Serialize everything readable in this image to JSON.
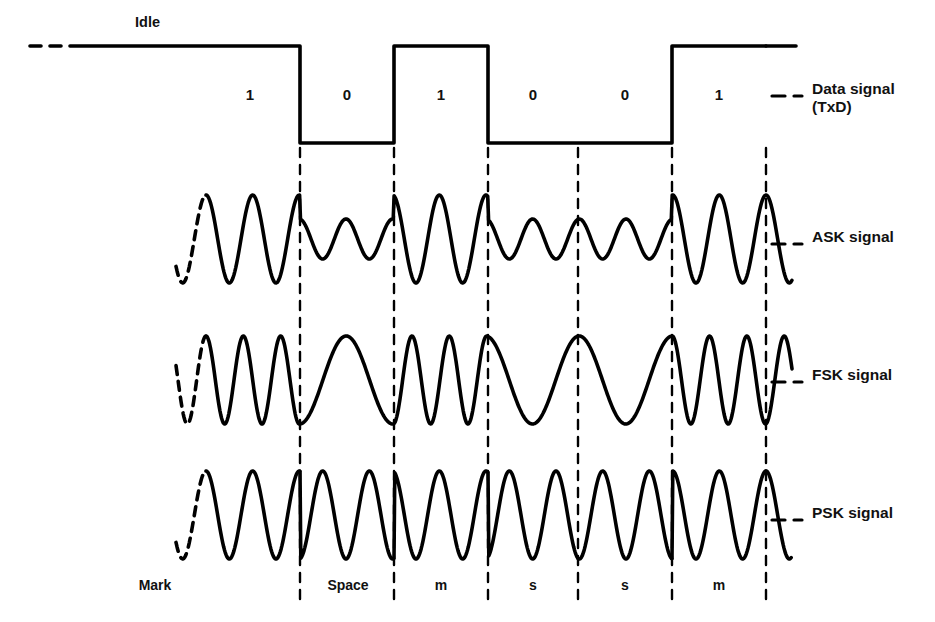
{
  "figure": {
    "idle_label": "Idle",
    "data_signal_label": "Data signal\n(TxD)",
    "ask_label": "ASK signal",
    "fsk_label": "FSK signal",
    "psk_label": "PSK signal",
    "line_color": "#000000",
    "background_color": "#ffffff"
  },
  "bits": [
    {
      "value": "1",
      "state": "mark",
      "bottom_label": "Mark"
    },
    {
      "value": "0",
      "state": "space",
      "bottom_label": "Space"
    },
    {
      "value": "1",
      "state": "mark",
      "bottom_label": "m"
    },
    {
      "value": "0",
      "state": "space",
      "bottom_label": "s"
    },
    {
      "value": "0",
      "state": "space",
      "bottom_label": "s"
    },
    {
      "value": "1",
      "state": "mark",
      "bottom_label": "m"
    }
  ],
  "chart_data": {
    "type": "line",
    "xlabel": "",
    "ylabel": "",
    "grid": false,
    "legend_position": "right",
    "bit_sequence": [
      "1",
      "0",
      "1",
      "0",
      "0",
      "1"
    ],
    "bit_boundaries_px": [
      300,
      394,
      488,
      578,
      672,
      766
    ],
    "signal_start_px": 206,
    "series": [
      {
        "name": "Data signal (TxD)",
        "type": "digital",
        "levels": [
          1,
          0,
          1,
          0,
          0,
          1
        ],
        "idle_level": 1,
        "high_y_px": 46,
        "low_y_px": 143
      },
      {
        "name": "ASK signal",
        "type": "amplitude-shift-keying",
        "center_y_px": 239,
        "amplitude_mark_px": 44,
        "amplitude_space_px": 20,
        "cycles_per_bit": 2,
        "description": "Large amplitude carrier for 1 (mark), small amplitude carrier for 0 (space)"
      },
      {
        "name": "FSK signal",
        "type": "frequency-shift-keying",
        "center_y_px": 380,
        "amplitude_px": 44,
        "cycles_per_bit_mark": 2.5,
        "cycles_per_bit_space": 1,
        "description": "High frequency carrier for 1 (mark), low frequency carrier for 0 (space)"
      },
      {
        "name": "PSK signal",
        "type": "phase-shift-keying",
        "center_y_px": 515,
        "amplitude_px": 44,
        "cycles_per_bit": 2,
        "phase_reversal_at_bit_change": true,
        "description": "Constant amplitude and frequency; phase reverses 180 degrees at each bit change"
      }
    ]
  }
}
